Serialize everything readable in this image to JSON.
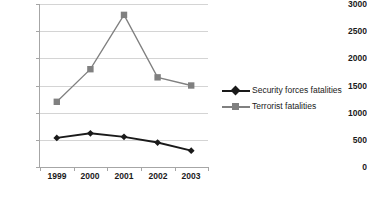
{
  "chart_data": {
    "type": "line",
    "title": "",
    "xlabel": "",
    "ylabel": "",
    "categories": [
      "1999",
      "2000",
      "2001",
      "2002",
      "2003"
    ],
    "ylim": [
      0,
      3000
    ],
    "ytick_step": 500,
    "yticks": [
      "3000",
      "2500",
      "2000",
      "1500",
      "1000",
      "500",
      "0"
    ],
    "grid": true,
    "legend_position": "right",
    "series": [
      {
        "name": "Security forces fatalities",
        "values": [
          535,
          620,
          555,
          450,
          300
        ],
        "color": "#1a1a1a",
        "marker": "diamond"
      },
      {
        "name": "Terrorist fatalities",
        "values": [
          1200,
          1800,
          2800,
          1650,
          1500
        ],
        "color": "#808080",
        "marker": "square"
      }
    ]
  },
  "legend": {
    "items": [
      {
        "label": "Security forces fatalities",
        "color": "#1a1a1a",
        "marker": "diamond"
      },
      {
        "label": "Terrorist fatalities",
        "color": "#808080",
        "marker": "square"
      }
    ]
  }
}
